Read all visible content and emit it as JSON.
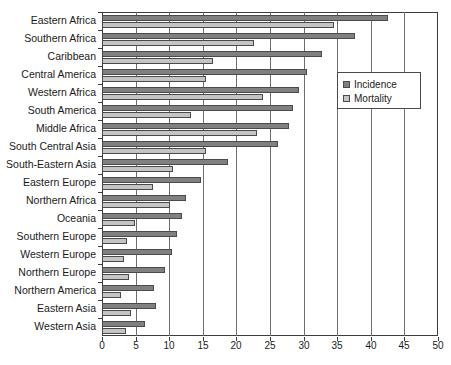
{
  "chart_data": {
    "type": "bar",
    "orientation": "horizontal",
    "title": "",
    "xlabel": "",
    "ylabel": "",
    "xlim": [
      0,
      50
    ],
    "xticks": [
      0,
      5,
      10,
      15,
      20,
      25,
      30,
      35,
      40,
      45,
      50
    ],
    "grid": true,
    "grid_axis": "x",
    "legend_position": "center-right",
    "categories": [
      "Eastern Africa",
      "Southern Africa",
      "Caribbean",
      "Central America",
      "Western Africa",
      "South America",
      "Middle Africa",
      "South Central Asia",
      "South-Eastern Asia",
      "Eastern Europe",
      "Northern Africa",
      "Oceania",
      "Southern Europe",
      "Western Europe",
      "Northern Europe",
      "Northern America",
      "Eastern Asia",
      "Western Asia"
    ],
    "series": [
      {
        "name": "Incidence",
        "color": "#808080",
        "values": [
          42.6,
          37.6,
          32.7,
          30.5,
          29.3,
          28.4,
          27.8,
          26.2,
          18.8,
          14.8,
          12.5,
          11.9,
          11.2,
          10.4,
          9.4,
          7.8,
          8.0,
          6.4
        ]
      },
      {
        "name": "Mortality",
        "color": "#c4c4c4",
        "values": [
          34.5,
          22.6,
          16.5,
          15.5,
          24.0,
          13.2,
          23.1,
          15.5,
          10.5,
          7.6,
          10.1,
          4.9,
          3.7,
          3.3,
          4.0,
          2.8,
          4.3,
          3.6
        ]
      }
    ]
  },
  "legend": {
    "entries": [
      {
        "label": "Incidence",
        "color": "#808080"
      },
      {
        "label": "Mortality",
        "color": "#c4c4c4"
      }
    ]
  },
  "axis": {
    "x_tick_labels": [
      "0",
      "5",
      "10",
      "15",
      "20",
      "25",
      "30",
      "35",
      "40",
      "45",
      "50"
    ]
  },
  "caption": ""
}
